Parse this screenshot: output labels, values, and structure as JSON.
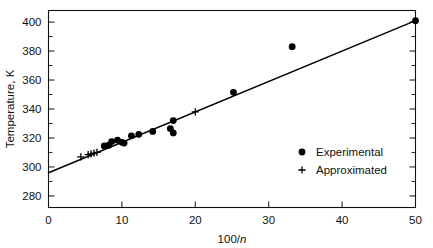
{
  "chart_data": {
    "type": "scatter",
    "title": "",
    "subtitle": "",
    "xlabel": "100/n",
    "xlabel_plain": "100/",
    "xlabel_italic": "n",
    "ylabel": "Temperature, K",
    "xlim": [
      0,
      50
    ],
    "ylim": [
      272,
      408
    ],
    "grid": false,
    "x_ticks_major": [
      0,
      10,
      20,
      30,
      40,
      50
    ],
    "x_tick_labels": [
      "0",
      "10",
      "20",
      "30",
      "40",
      "50"
    ],
    "y_ticks_major": [
      280,
      300,
      320,
      340,
      360,
      380,
      400
    ],
    "y_tick_labels": [
      "280",
      "300",
      "320",
      "340",
      "360",
      "380",
      "400"
    ],
    "y_ticks_minor": [
      290,
      310,
      330,
      350,
      370,
      390
    ],
    "legend_position": "center-right-inside",
    "series": [
      {
        "name": "Experimental",
        "marker": "filled-circle",
        "color": "#000000",
        "points": [
          {
            "x": 7.6,
            "y": 314.5
          },
          {
            "x": 8.2,
            "y": 315.0
          },
          {
            "x": 8.6,
            "y": 317.5
          },
          {
            "x": 9.4,
            "y": 318.5
          },
          {
            "x": 10.0,
            "y": 317.0
          },
          {
            "x": 10.3,
            "y": 316.5
          },
          {
            "x": 11.3,
            "y": 321.5
          },
          {
            "x": 12.3,
            "y": 322.5
          },
          {
            "x": 14.2,
            "y": 324.5
          },
          {
            "x": 16.6,
            "y": 326.5
          },
          {
            "x": 17.0,
            "y": 332.0
          },
          {
            "x": 17.0,
            "y": 323.5
          },
          {
            "x": 25.2,
            "y": 351.5
          },
          {
            "x": 33.2,
            "y": 383.0
          },
          {
            "x": 50.0,
            "y": 401.0
          }
        ]
      },
      {
        "name": "Approximated",
        "marker": "plus",
        "color": "#000000",
        "points": [
          {
            "x": 4.4,
            "y": 307.0
          },
          {
            "x": 5.4,
            "y": 308.5
          },
          {
            "x": 5.8,
            "y": 309.0
          },
          {
            "x": 6.2,
            "y": 309.5
          },
          {
            "x": 6.6,
            "y": 310.0
          },
          {
            "x": 20.0,
            "y": 338.0
          }
        ]
      }
    ],
    "fit_line": {
      "name": "linear-fit",
      "x_start": 0,
      "y_start": 296.0,
      "x_end": 50,
      "y_end": 401.0
    },
    "legend": [
      {
        "label": "Experimental",
        "marker": "filled-circle"
      },
      {
        "label": "Approximated",
        "marker": "plus"
      }
    ]
  }
}
